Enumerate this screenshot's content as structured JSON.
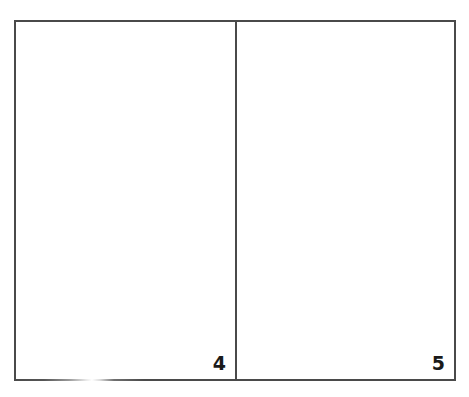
{
  "document": {
    "type": "two-page spread",
    "pages": [
      {
        "side": "left",
        "page_number": "4",
        "content": ""
      },
      {
        "side": "right",
        "page_number": "5",
        "content": ""
      }
    ]
  },
  "colors": {
    "border": "#4a4a4a",
    "page_background": "#ffffff",
    "page_number_text": "#1a1a1a"
  }
}
